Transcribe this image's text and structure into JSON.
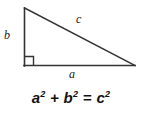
{
  "figure": {
    "background_color": "#ffffff",
    "stroke_color": "#333333",
    "text_color": "#1a1a1a"
  },
  "diagram": {
    "shape": "right-triangle",
    "vertices": {
      "apex": {
        "x": 24,
        "y": 8
      },
      "right_angle": {
        "x": 24,
        "y": 66
      },
      "base_right": {
        "x": 135,
        "y": 65
      }
    },
    "right_angle_marker": {
      "present": true,
      "size": 9,
      "at": "bottom-left-vertex"
    },
    "labels": [
      {
        "id": "b",
        "text": "b",
        "side": "vertical-leg",
        "x": 4,
        "y": 29
      },
      {
        "id": "c",
        "text": "c",
        "side": "hypotenuse",
        "x": 76,
        "y": 13
      },
      {
        "id": "a",
        "text": "a",
        "side": "horizontal-leg",
        "x": 69,
        "y": 68
      }
    ]
  },
  "equation": {
    "full_text": "a² + b² = c²",
    "term_a_base": "a",
    "term_a_exp": "2",
    "operator_plus": " + ",
    "term_b_base": "b",
    "term_b_exp": "2",
    "operator_equals": " = ",
    "term_c_base": "c",
    "term_c_exp": "2"
  }
}
